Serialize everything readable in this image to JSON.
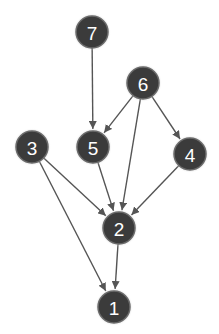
{
  "diagram": {
    "type": "directed-graph",
    "colors": {
      "node_fill": "#3b3b3b",
      "node_stroke": "#6a6a6a",
      "edge": "#555555",
      "label": "#ffffff",
      "background": "#ffffff"
    },
    "node_radius": 16,
    "nodes": [
      {
        "id": "7",
        "label": "7",
        "x": 92,
        "y": 32
      },
      {
        "id": "6",
        "label": "6",
        "x": 143,
        "y": 83
      },
      {
        "id": "5",
        "label": "5",
        "x": 93,
        "y": 147
      },
      {
        "id": "3",
        "label": "3",
        "x": 32,
        "y": 147
      },
      {
        "id": "4",
        "label": "4",
        "x": 190,
        "y": 154
      },
      {
        "id": "2",
        "label": "2",
        "x": 119,
        "y": 228
      },
      {
        "id": "1",
        "label": "1",
        "x": 114,
        "y": 307
      }
    ],
    "edges": [
      {
        "from": "7",
        "to": "5"
      },
      {
        "from": "6",
        "to": "5"
      },
      {
        "from": "6",
        "to": "2"
      },
      {
        "from": "6",
        "to": "4"
      },
      {
        "from": "5",
        "to": "2"
      },
      {
        "from": "3",
        "to": "2"
      },
      {
        "from": "3",
        "to": "1"
      },
      {
        "from": "4",
        "to": "2"
      },
      {
        "from": "2",
        "to": "1"
      }
    ]
  }
}
